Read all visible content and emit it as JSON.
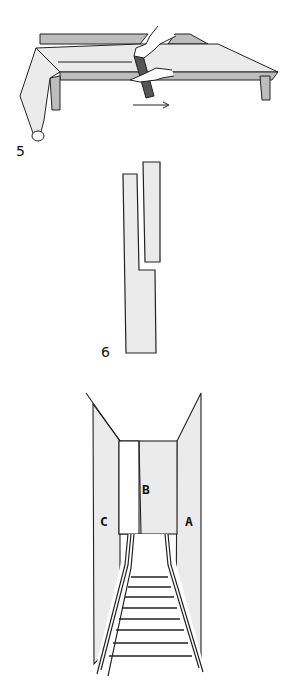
{
  "figures": [
    {
      "number": "5",
      "description": "Hands cutting a long roll of paper along a table edge with a straightedge, arrow pointing right"
    },
    {
      "number": "6",
      "description": "Two vertical paper strips, shorter one offset to the upper right"
    },
    {
      "number": "",
      "description": "Perspective view of a corridor with walls labeled C, B, A and a railway track leading in",
      "labels": {
        "left": "C",
        "center": "B",
        "right": "A"
      }
    }
  ],
  "colors": {
    "line": "#222222",
    "fill": "#ebebeb",
    "shade": "#bdbdbd",
    "background": "#ffffff"
  }
}
